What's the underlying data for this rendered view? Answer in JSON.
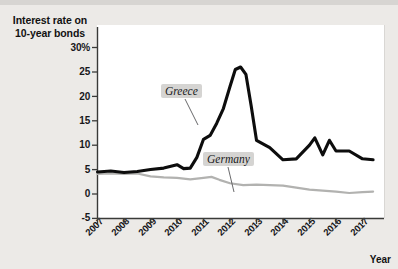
{
  "chart": {
    "title_line1": "Interest rate on",
    "title_line2": "10-year bonds",
    "xaxis_title": "Year",
    "y_ticks": [
      "30%",
      "25",
      "20",
      "15",
      "10",
      "5",
      "0",
      "-5"
    ],
    "x_ticks": [
      "2007",
      "2008",
      "2009",
      "2010",
      "2011",
      "2012",
      "2013",
      "2014",
      "2015",
      "2016",
      "2017"
    ],
    "annotations": [
      {
        "id": "greece",
        "label": "Greece"
      },
      {
        "id": "germany",
        "label": "Germany"
      }
    ],
    "colors": {
      "greece_line": "#0d0d0d",
      "germany_line": "#b2b2b0",
      "plot_background": "#ffffff",
      "page_background": "#eceae7",
      "axis": "#3a3a38",
      "callout_background": "#d5d4d2"
    }
  },
  "chart_data": {
    "type": "line",
    "title": "Interest rate on 10-year bonds",
    "xlabel": "Year",
    "ylabel": "Interest rate on 10-year bonds",
    "ylim": [
      -5,
      30
    ],
    "yticks": [
      -5,
      0,
      5,
      10,
      15,
      20,
      25,
      30
    ],
    "ytick_labels": [
      "-5",
      "0",
      "5",
      "10",
      "15",
      "20",
      "25",
      "30%"
    ],
    "xlim": [
      2007,
      2017.5
    ],
    "xticks": [
      2007,
      2008,
      2009,
      2010,
      2011,
      2012,
      2013,
      2014,
      2015,
      2016,
      2017
    ],
    "grid": false,
    "legend": "inline-annotations",
    "series": [
      {
        "name": "Greece",
        "color": "#0d0d0d",
        "x": [
          2007.0,
          2007.5,
          2008.0,
          2008.5,
          2009.0,
          2009.5,
          2010.0,
          2010.25,
          2010.5,
          2010.75,
          2011.0,
          2011.25,
          2011.5,
          2011.75,
          2012.0,
          2012.2,
          2012.4,
          2012.6,
          2012.8,
          2013.0,
          2013.5,
          2014.0,
          2014.5,
          2015.0,
          2015.2,
          2015.5,
          2015.75,
          2016.0,
          2016.5,
          2017.0,
          2017.4
        ],
        "values": [
          4.5,
          4.7,
          4.4,
          4.6,
          5.0,
          5.3,
          6.0,
          5.2,
          5.3,
          7.5,
          11.2,
          12.0,
          14.5,
          17.5,
          22.0,
          25.5,
          26.0,
          24.5,
          18.0,
          11.0,
          9.5,
          7.0,
          7.2,
          10.0,
          11.5,
          8.0,
          11.0,
          8.8,
          8.8,
          7.2,
          7.0
        ],
        "peak": {
          "x": 2012.4,
          "y": 26.0
        }
      },
      {
        "name": "Germany",
        "color": "#b2b2b0",
        "x": [
          2007.0,
          2007.5,
          2008.0,
          2008.5,
          2009.0,
          2009.5,
          2010.0,
          2010.5,
          2011.0,
          2011.3,
          2011.6,
          2012.0,
          2012.5,
          2013.0,
          2013.5,
          2014.0,
          2014.5,
          2015.0,
          2015.5,
          2016.0,
          2016.5,
          2017.0,
          2017.4
        ],
        "values": [
          4.1,
          4.2,
          4.1,
          4.2,
          3.6,
          3.4,
          3.3,
          3.0,
          3.3,
          3.5,
          2.9,
          2.2,
          1.8,
          1.9,
          1.8,
          1.7,
          1.3,
          0.9,
          0.7,
          0.5,
          0.2,
          0.4,
          0.5
        ]
      }
    ],
    "annotations": [
      {
        "text": "Greece",
        "points_to_series": "Greece",
        "x": 2010.9,
        "y": 19.0
      },
      {
        "text": "Germany",
        "points_to_series": "Germany",
        "x": 2012.1,
        "y": 9.0
      }
    ]
  }
}
